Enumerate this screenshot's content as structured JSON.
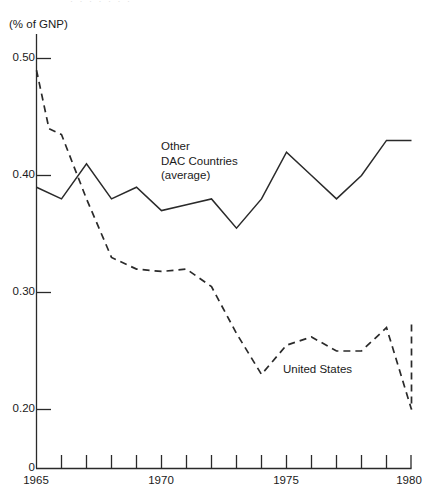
{
  "figure": {
    "unit_label": "(% of GNP)",
    "top_bleed_text": "·  ·   ·  ·  ·   ·   ·"
  },
  "annotations": {
    "dac": {
      "line1": "Other",
      "line2": "DAC Countries",
      "line3": "(average)"
    },
    "united_states": "United States"
  },
  "axes": {
    "y_tick_labels": [
      "0.50",
      "0.40",
      "0.30",
      "0.20",
      "0"
    ],
    "x_tick_labels": [
      "1965",
      "1970",
      "1975",
      "1980"
    ]
  },
  "chart_data": {
    "type": "line",
    "title": "",
    "subtitle": "",
    "xlabel": "",
    "ylabel": "(% of GNP)",
    "xlim": [
      1965,
      1980
    ],
    "ylim": [
      0.0,
      0.52
    ],
    "y_axis_break": true,
    "y_axis_break_note": "axis is linear from 0.20 upward; 0 baseline is compressed below 0.20",
    "grid": false,
    "legend_position": "inline-annotations",
    "y_ticks": [
      0.5,
      0.4,
      0.3,
      0.2,
      0.0
    ],
    "x_ticks": [
      1965,
      1966,
      1967,
      1968,
      1969,
      1970,
      1971,
      1972,
      1973,
      1974,
      1975,
      1976,
      1977,
      1978,
      1979,
      1980
    ],
    "x_tick_labels_shown": [
      1965,
      1970,
      1975,
      1980
    ],
    "x": [
      1965,
      1966,
      1967,
      1968,
      1969,
      1970,
      1971,
      1972,
      1973,
      1974,
      1975,
      1976,
      1977,
      1978,
      1979,
      1980
    ],
    "series": [
      {
        "name": "Other DAC Countries (average)",
        "style": "solid",
        "color": "#1a1a1a",
        "values": [
          0.39,
          0.38,
          0.41,
          0.38,
          0.39,
          0.37,
          0.375,
          0.38,
          0.355,
          0.38,
          0.42,
          0.4,
          0.38,
          0.4,
          0.43,
          0.43
        ]
      },
      {
        "name": "United States",
        "style": "dashed",
        "color": "#1a1a1a",
        "x": [
          1965,
          1965.5,
          1966,
          1967,
          1968,
          1969,
          1970,
          1971,
          1972,
          1973,
          1974,
          1975,
          1976,
          1977,
          1978,
          1979,
          1980
        ],
        "values": [
          0.49,
          0.44,
          0.435,
          0.38,
          0.33,
          0.32,
          0.318,
          0.32,
          0.305,
          0.265,
          0.23,
          0.255,
          0.262,
          0.25,
          0.25,
          0.27,
          0.2
        ],
        "values_extended_note": "final point rises to 0.275 at 1980",
        "final_value": 0.275
      }
    ]
  }
}
